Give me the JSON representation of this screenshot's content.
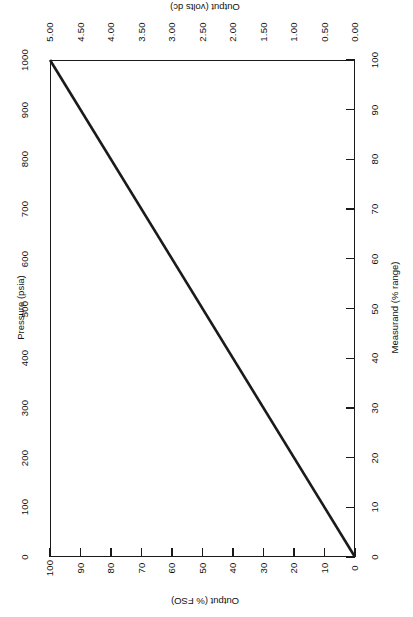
{
  "chart_data": {
    "type": "line",
    "title": "",
    "subtitle": "",
    "orientation": "rotated-90",
    "grid": false,
    "legend": null,
    "series": [
      {
        "name": "Transfer function",
        "color": "#1a1a1a",
        "line_width": 2.6,
        "x": [
          0,
          100
        ],
        "y": [
          100,
          0
        ],
        "points": [
          {
            "measurand_pct": 0,
            "output_pct_fso": 100,
            "output_volts": 5.0,
            "pressure_psia": 0
          },
          {
            "measurand_pct": 100,
            "output_pct_fso": 0,
            "output_volts": 0.0,
            "pressure_psia": 1000
          }
        ]
      }
    ],
    "axes": {
      "pressure": {
        "label": "Pressure (psia)",
        "position": "left",
        "lim": [
          0,
          1000
        ],
        "ticks": [
          0,
          100,
          200,
          300,
          400,
          500,
          600,
          700,
          800,
          900,
          1000
        ],
        "tick_labels": [
          "0",
          "100",
          "200",
          "300",
          "400",
          "500",
          "600",
          "700",
          "800",
          "900",
          "1000"
        ],
        "tick_marks_visible": false,
        "direction": "bottom-to-top"
      },
      "output_volts": {
        "label": "Output (volts dc)",
        "position": "top",
        "lim": [
          0.0,
          5.0
        ],
        "ticks": [
          5.0,
          4.5,
          4.0,
          3.5,
          3.0,
          2.5,
          2.0,
          1.5,
          1.0,
          0.5,
          0.0
        ],
        "tick_labels": [
          "5.00",
          "4.50",
          "4.00",
          "3.50",
          "3.00",
          "2.50",
          "2.00",
          "1.50",
          "1.00",
          "0.50",
          "0.00"
        ],
        "tick_marks_visible": false,
        "direction": "left-to-right-descending"
      },
      "output_fso": {
        "label": "Output (% FSO)",
        "position": "bottom",
        "lim": [
          0,
          100
        ],
        "ticks": [
          100,
          90,
          80,
          70,
          60,
          50,
          40,
          30,
          20,
          10,
          0
        ],
        "tick_labels": [
          "100",
          "90",
          "80",
          "70",
          "60",
          "50",
          "40",
          "30",
          "20",
          "10",
          "0"
        ],
        "tick_marks_visible": true,
        "direction": "left-to-right-descending"
      },
      "measurand": {
        "label": "Measurand (% range)",
        "position": "right",
        "lim": [
          0,
          100
        ],
        "ticks": [
          0,
          10,
          20,
          30,
          40,
          50,
          60,
          70,
          80,
          90,
          100
        ],
        "tick_labels": [
          "0",
          "10",
          "20",
          "30",
          "40",
          "50",
          "60",
          "70",
          "80",
          "90",
          "100"
        ],
        "tick_marks_visible": true,
        "direction": "bottom-to-top"
      }
    },
    "colors": {
      "line": "#1a1a1a",
      "frame": "#1a1a1a",
      "background": "#ffffff",
      "text": "#111111"
    }
  }
}
